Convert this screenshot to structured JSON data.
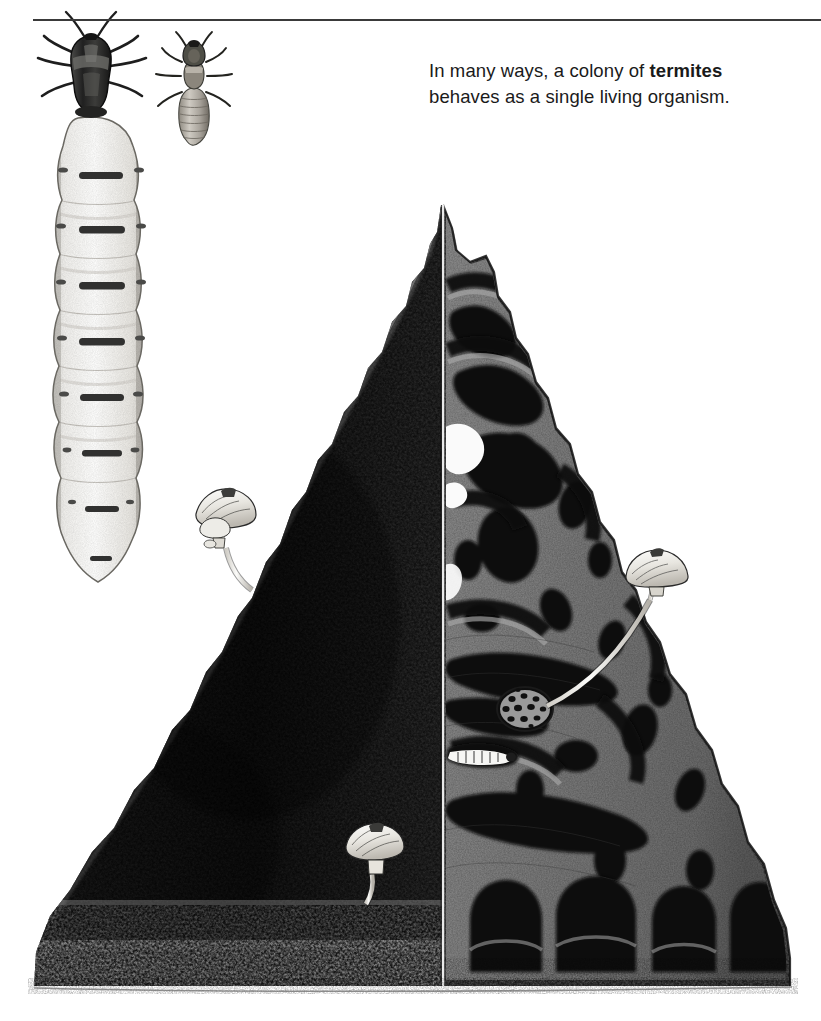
{
  "figure": {
    "kind": "scientific-illustration",
    "rule": {
      "visible": true,
      "color": "#3a3a3a"
    },
    "background_color": "#ffffff"
  },
  "caption": {
    "text_before_bold": "In many ways, a colony of ",
    "bold_word": "termites",
    "text_after_bold": " behaves as a single living organism.",
    "full_text": "In many ways, a colony of termites behaves as a single living organism."
  },
  "specimens": [
    {
      "name": "termite-queen-specimen",
      "label": "",
      "description": "large physogastric queen with dark head and thorax and greatly swollen pale segmented abdomen",
      "segments": 6,
      "body_color": "#f2f2f0",
      "head_color": "#2b2b2b"
    },
    {
      "name": "termite-worker-specimen",
      "label": "",
      "description": "smaller worker termite, pale banded abdomen, dark head",
      "body_color": "#b9b4ab",
      "head_color": "#3a3a3a"
    }
  ],
  "mound": {
    "name": "termite-mound",
    "description": "tall conical earthen termite mound; left half shows stippled dark exterior, right half is a cutaway revealing the internal gallery network",
    "exterior_color": "#1f1f1f",
    "cutaway_matrix_color": "#7b7b7b",
    "chamber_color": "#0d0d0d",
    "cut_plane_x": 443,
    "apex": {
      "x": 441,
      "y": 205
    },
    "base": {
      "left_x": 34,
      "right_x": 790,
      "y": 986
    }
  },
  "internal_features": [
    {
      "name": "fungus-comb-chamber",
      "description": "oval fungus comb / fungus garden chamber with sponge-like perforations",
      "x": 525,
      "y": 709,
      "width": 52,
      "height": 40
    },
    {
      "name": "royal-chamber-queen",
      "description": "queen with white segmented abdomen lying inside the royal cell",
      "x": 483,
      "y": 757
    },
    {
      "name": "gallery-network",
      "description": "branching tunnels, ventilation shafts and brood chambers filling the cutaway"
    },
    {
      "name": "central-chimney-void",
      "description": "pale open chimney void just right of the cut plane near the upper mound",
      "x": 452,
      "y": 460
    },
    {
      "name": "basal-vault-row",
      "description": "row of large dark vaulted cellar chambers along the mound base"
    }
  ],
  "mushrooms": [
    {
      "name": "mushroom-upper-left",
      "description": "cluster of pale termitomyces mushrooms on the upper left flank with curving stalk",
      "x": 224,
      "y": 521,
      "cap_width": 62
    },
    {
      "name": "mushroom-lower-left",
      "description": "single pale mushroom low on the left flank",
      "x": 376,
      "y": 856,
      "cap_width": 58
    },
    {
      "name": "mushroom-right-exterior",
      "description": "pale mushroom on the right outer slope, its long white stalk running down into the fungus comb",
      "x": 657,
      "y": 572,
      "cap_width": 62
    }
  ],
  "ground": {
    "name": "ground-line",
    "description": "stippled soil surface fading out beneath the mound",
    "y": 986
  }
}
